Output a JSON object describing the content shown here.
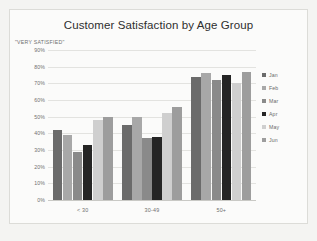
{
  "card": {
    "title": "Customer Satisfaction by Age Group",
    "axis_note": "\"VERY SATISFIED\""
  },
  "chart_data": {
    "type": "bar",
    "title": "Customer Satisfaction by Age Group",
    "subtitle": "\"VERY SATISFIED\"",
    "xlabel": "",
    "ylabel": "\"VERY SATISFIED\"",
    "categories": [
      "< 30",
      "30-49",
      "50+"
    ],
    "series": [
      {
        "name": "Jan",
        "color": "#6b6b6b",
        "values": [
          42,
          45,
          74
        ]
      },
      {
        "name": "Feb",
        "color": "#a8a8a8",
        "values": [
          39,
          50,
          76
        ]
      },
      {
        "name": "Mar",
        "color": "#8a8a8a",
        "values": [
          29,
          37,
          72
        ]
      },
      {
        "name": "Apr",
        "color": "#252525",
        "values": [
          33,
          38,
          75
        ]
      },
      {
        "name": "May",
        "color": "#cfcfcf",
        "values": [
          48,
          52,
          70
        ]
      },
      {
        "name": "Jun",
        "color": "#9d9d9d",
        "values": [
          50,
          56,
          77
        ]
      }
    ],
    "ylim": [
      0,
      90
    ],
    "y_ticks": [
      "0%",
      "10%",
      "20%",
      "30%",
      "40%",
      "50%",
      "60%",
      "70%",
      "80%",
      "90%"
    ],
    "y_tick_values": [
      0,
      10,
      20,
      30,
      40,
      50,
      60,
      70,
      80,
      90
    ],
    "grid": true,
    "legend_position": "right",
    "value_suffix": "%"
  },
  "legend": {
    "items": [
      {
        "label": "Jan",
        "color": "#6b6b6b"
      },
      {
        "label": "Feb",
        "color": "#a8a8a8"
      },
      {
        "label": "Mar",
        "color": "#8a8a8a"
      },
      {
        "label": "Apr",
        "color": "#252525"
      },
      {
        "label": "May",
        "color": "#cfcfcf"
      },
      {
        "label": "Jun",
        "color": "#9d9d9d"
      }
    ]
  }
}
